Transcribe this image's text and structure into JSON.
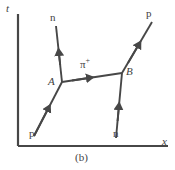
{
  "figure": {
    "caption": "(b)",
    "line_color": "#474747",
    "text_color": "#3f3f3f",
    "background": "#ffffff"
  },
  "axes": {
    "t_label": "t",
    "x_label": "x",
    "origin": [
      18,
      146
    ],
    "t_top": [
      18,
      14
    ],
    "x_right": [
      168,
      146
    ]
  },
  "vertices": [
    {
      "id": "A",
      "label": "A",
      "x": 62,
      "y": 82
    },
    {
      "id": "B",
      "label": "B",
      "x": 122,
      "y": 73
    }
  ],
  "particles": [
    {
      "name": "proton-in",
      "label": "p",
      "from": [
        34,
        136
      ],
      "to": [
        62,
        82
      ],
      "arrow_dir": "up-right",
      "label_pos": [
        30,
        132
      ]
    },
    {
      "name": "neutron-out",
      "label": "n",
      "from": [
        62,
        82
      ],
      "to": [
        56,
        26
      ],
      "arrow_dir": "up",
      "label_pos": [
        50,
        14
      ]
    },
    {
      "name": "pion-exchange",
      "label": "π",
      "superscript": "+",
      "from": [
        62,
        82
      ],
      "to": [
        122,
        73
      ],
      "arrow_dir": "right",
      "label_pos": [
        82,
        62
      ]
    },
    {
      "name": "neutron-in",
      "label": "n",
      "from": [
        116,
        138
      ],
      "to": [
        122,
        73
      ],
      "arrow_dir": "up",
      "label_pos": [
        113,
        132
      ]
    },
    {
      "name": "proton-out",
      "label": "p",
      "from": [
        122,
        73
      ],
      "to": [
        152,
        22
      ],
      "arrow_dir": "up-right",
      "label_pos": [
        148,
        12
      ]
    }
  ]
}
